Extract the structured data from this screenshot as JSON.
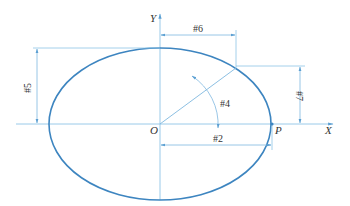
{
  "diagram": {
    "type": "ellipse-geometry",
    "axes": {
      "x_label": "X",
      "y_label": "Y",
      "origin_label": "O"
    },
    "point_label": "P",
    "dimensions": {
      "d2": "#2",
      "d4": "#4",
      "d5": "#5",
      "d6": "#6",
      "d7": "#7"
    },
    "colors": {
      "curve": "#3d85c0",
      "lines": "#8ec4e6",
      "text": "#333333"
    }
  }
}
